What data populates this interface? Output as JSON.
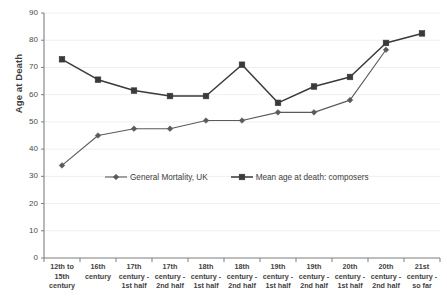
{
  "chart_data": {
    "type": "line",
    "title": "",
    "xlabel": "",
    "ylabel": "Age at Death",
    "ylim": [
      0,
      90
    ],
    "ytick_step": 10,
    "yticks": [
      0,
      10,
      20,
      30,
      40,
      50,
      60,
      70,
      80,
      90
    ],
    "grid": true,
    "grid_axis": "y",
    "legend_position": "inside-lower-center",
    "categories": [
      "12th to 15th century",
      "16th century",
      "17th century - 1st half",
      "17th century - 2nd half",
      "18th century - 1st half",
      "18th century - 2nd half",
      "19th century - 1st half",
      "19th century - 2nd half",
      "20th century - 1st half",
      "20th century - 2nd half",
      "21st century - so far"
    ],
    "series": [
      {
        "name": "General Mortality, UK",
        "color": "#5a5a5a",
        "marker": "diamond",
        "values": [
          34,
          45,
          47.5,
          47.5,
          50.5,
          50.5,
          53.5,
          53.5,
          58,
          76.5,
          null
        ]
      },
      {
        "name": "Mean age at death: composers",
        "color": "#3a3a3a",
        "marker": "square",
        "values": [
          73,
          65.5,
          61.5,
          59.5,
          59.5,
          71,
          57,
          63,
          66.5,
          79,
          82.5
        ]
      }
    ]
  },
  "axis": {
    "y_title": "Age at Death"
  },
  "colors": {
    "background": "#ffffff",
    "axis": "#7f7f7f",
    "gridline": "#efefef",
    "series_mortality": "#5a5a5a",
    "series_composers": "#3a3a3a",
    "text": "#3f3f3f"
  }
}
